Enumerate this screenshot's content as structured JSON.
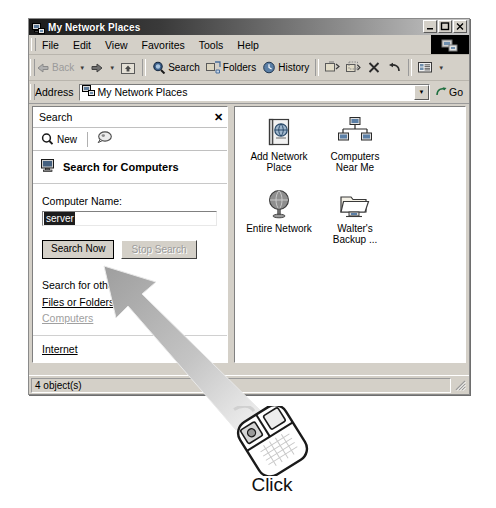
{
  "window": {
    "title": "My Network Places",
    "icon": "network-places-icon",
    "controls": {
      "minimize": "_",
      "maximize": "❐",
      "close": "✕"
    }
  },
  "menubar": {
    "items": [
      {
        "label": "File"
      },
      {
        "label": "Edit"
      },
      {
        "label": "View"
      },
      {
        "label": "Favorites"
      },
      {
        "label": "Tools"
      },
      {
        "label": "Help"
      }
    ]
  },
  "toolbar": {
    "back": "Back",
    "forward": "",
    "up": "",
    "search": "Search",
    "folders": "Folders",
    "history": "History",
    "move_to": "",
    "copy_to": "",
    "delete": "",
    "undo": "",
    "views": ""
  },
  "addressbar": {
    "label": "Address",
    "value": "My Network Places",
    "go": "Go"
  },
  "search_pane": {
    "title": "Search",
    "close": "✕",
    "new_button": "New",
    "heading": "Search for Computers",
    "computer_name_label": "Computer Name:",
    "computer_name_value": "server",
    "search_now": "Search Now",
    "stop_search": "Stop Search",
    "other_title": "Search for other items:",
    "links": [
      {
        "label": "Files or Folders",
        "dim": false
      },
      {
        "label": "Computers",
        "dim": true
      },
      {
        "label": "Internet",
        "dim": false
      }
    ]
  },
  "file_pane": {
    "items": [
      {
        "label": "Add Network\nPlace",
        "icon": "add-network-place-icon"
      },
      {
        "label": "Computers\nNear Me",
        "icon": "computers-near-me-icon"
      },
      {
        "label": "Entire Network",
        "icon": "entire-network-globe-icon"
      },
      {
        "label": "Walter's\nBackup ...",
        "icon": "shared-folder-icon"
      }
    ]
  },
  "statusbar": {
    "text": "4 object(s)"
  },
  "callout": {
    "label": "Click",
    "icon": "computer-mouse-icon"
  },
  "colors": {
    "window_face": "#d4d0c8",
    "pane_white": "#ffffff",
    "title_dark": "#1b1b1b",
    "selection": "#1c1c1c",
    "disabled_text": "#9a9a9a"
  }
}
